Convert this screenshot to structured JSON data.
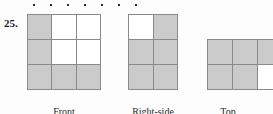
{
  "exercise": {
    "number": "25."
  },
  "separator": {
    "style": "dotted-rule",
    "dot_count": 7,
    "dot_color": "#2b2b2b",
    "first_dot_x": 33,
    "dot_spacing": 17
  },
  "palette": {
    "shaded_cell": "#cbcbcb",
    "empty_cell": "#ffffff",
    "grid_line": "#8a8a8a",
    "text": "#2a2a2a",
    "background": "#fdfdfd"
  },
  "views": [
    {
      "key": "front",
      "label": "Front",
      "columns": 3,
      "rows": 3,
      "cells": [
        [
          1,
          0,
          0
        ],
        [
          1,
          0,
          0
        ],
        [
          1,
          1,
          1
        ]
      ]
    },
    {
      "key": "right-side",
      "label": "Right-side",
      "columns": 2,
      "rows": 3,
      "cells": [
        [
          0,
          1
        ],
        [
          1,
          1
        ],
        [
          1,
          1
        ]
      ]
    },
    {
      "key": "top",
      "label": "Top",
      "columns": 3,
      "rows": 2,
      "cells": [
        [
          1,
          1,
          1
        ],
        [
          1,
          1,
          0
        ]
      ]
    }
  ]
}
